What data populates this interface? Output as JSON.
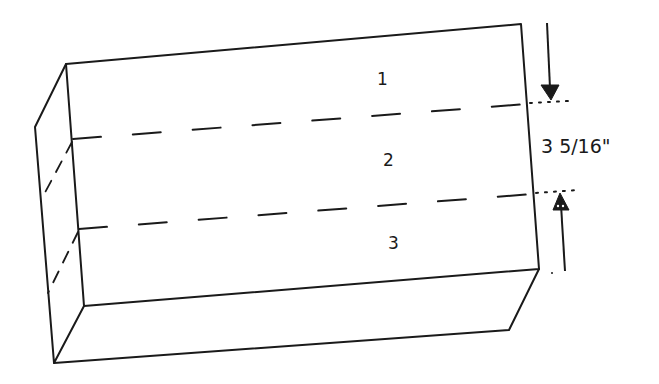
{
  "diagram": {
    "type": "isometric-block-sketch",
    "colors": {
      "line": "#1a1a1a",
      "background": "#ffffff"
    },
    "sections": [
      {
        "id": "section-1",
        "label": "1"
      },
      {
        "id": "section-2",
        "label": "2"
      },
      {
        "id": "section-3",
        "label": "3"
      }
    ],
    "dimension": {
      "label": "3 5/16\"",
      "applies_to": "section-2",
      "arrow_top": "down-arrow",
      "arrow_bottom": "up-arrow"
    }
  }
}
